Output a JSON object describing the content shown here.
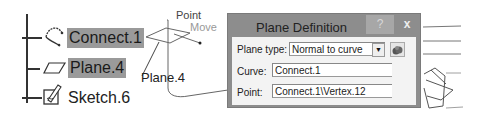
{
  "tree": {
    "items": [
      {
        "label": "Connect.1",
        "icon": "connect-curve-icon",
        "selected": true,
        "expandable": true
      },
      {
        "label": "Plane.4",
        "icon": "plane-icon",
        "selected": true,
        "expandable": false
      },
      {
        "label": "Sketch.6",
        "icon": "sketch-icon",
        "selected": false,
        "expandable": true
      }
    ]
  },
  "viewer": {
    "plane_label": "Plane.4",
    "point_label": "Point",
    "move_label": "Move"
  },
  "dialog": {
    "title": "Plane Definition",
    "help_label": "?",
    "close_label": "x",
    "plane_type_label": "Plane type:",
    "plane_type_value": "Normal to curve",
    "curve_label": "Curve:",
    "curve_value": "Connect.1",
    "point_label": "Point:",
    "point_value": "Connect.1\\Vertex.12"
  }
}
